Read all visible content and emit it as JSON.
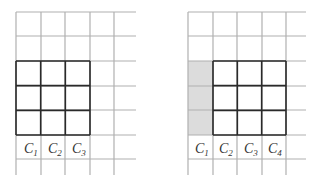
{
  "diagram": {
    "colors": {
      "grid_line": "#b0b0b0",
      "thick_line": "#2a2a2a",
      "shade": "#dcdcdc",
      "text": "#333333",
      "background": "#ffffff"
    },
    "left": {
      "name": "left-grid",
      "columns_x": [
        16,
        41,
        65,
        90,
        114
      ],
      "grid_right": 136,
      "rows_y": [
        12,
        36,
        61,
        86,
        110,
        135,
        159
      ],
      "grid_bottom": 175,
      "highlight_box": {
        "x1": 16,
        "y1": 61,
        "x2": 90,
        "y2": 135,
        "cols": 3,
        "rows": 3
      },
      "shaded_column": null,
      "labels": [
        {
          "text": "C",
          "sub": "1",
          "x": 24,
          "y": 153
        },
        {
          "text": "C",
          "sub": "2",
          "x": 48,
          "y": 153
        },
        {
          "text": "C",
          "sub": "3",
          "x": 72,
          "y": 153
        }
      ]
    },
    "right": {
      "name": "right-grid",
      "columns_x": [
        188,
        213,
        237,
        262,
        286
      ],
      "grid_right": 306,
      "rows_y": [
        12,
        36,
        61,
        86,
        110,
        135,
        159
      ],
      "grid_bottom": 175,
      "highlight_box": {
        "x1": 213,
        "y1": 61,
        "x2": 286,
        "y2": 135,
        "cols": 3,
        "rows": 3
      },
      "shaded_column": {
        "x1": 188,
        "y1": 61,
        "x2": 213,
        "y2": 135
      },
      "labels": [
        {
          "text": "C",
          "sub": "1",
          "x": 195,
          "y": 153
        },
        {
          "text": "C",
          "sub": "2",
          "x": 219,
          "y": 153
        },
        {
          "text": "C",
          "sub": "3",
          "x": 244,
          "y": 153
        },
        {
          "text": "C",
          "sub": "4",
          "x": 268,
          "y": 153
        }
      ]
    }
  }
}
